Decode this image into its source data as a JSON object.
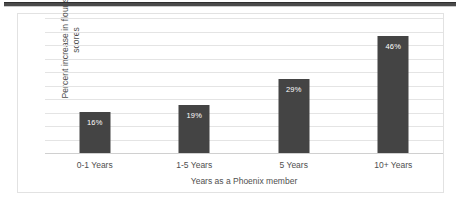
{
  "chart_data": {
    "type": "bar",
    "title": "",
    "subtitle": "",
    "xlabel": "Years as a Phoenix member",
    "ylabel": "Percent increase in flourishing scores",
    "categories": [
      "0-1 Years",
      "1-5 Years",
      "5 Years",
      "10+ Years"
    ],
    "values": [
      16,
      19,
      29,
      46
    ],
    "data_labels": [
      "16%",
      "19%",
      "29%",
      "46%"
    ],
    "ylim": [
      0,
      53
    ],
    "y_tick_labels": [],
    "gridlines": 11,
    "grid": true,
    "legend": false,
    "legend_position": "none",
    "series": [
      {
        "name": "Percent increase in flourishing scores",
        "values": [
          16,
          19,
          29,
          46
        ]
      }
    ]
  },
  "style": {
    "bar_color": "#444444",
    "gridline_color": "#e4e4e4",
    "axis_color": "#d0d0d0",
    "frame_border_color": "#e2e2e2",
    "plot_background": "#ffffff",
    "text_color": "#4f4f4f",
    "data_label_color": "#ffffff",
    "top_rule_color": "#4a4a4a"
  }
}
